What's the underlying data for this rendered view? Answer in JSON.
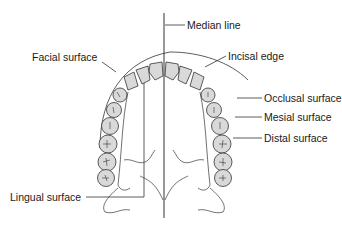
{
  "diagram": {
    "labels": {
      "median_line": "Median line",
      "facial_surface": "Facial surface",
      "incisal_edge": "Incisal edge",
      "occlusal_surface": "Occlusal surface",
      "mesial_surface": "Mesial surface",
      "distal_surface": "Distal surface",
      "lingual_surface": "Lingual surface"
    },
    "colors": {
      "tooth_fill": "#d9d9d9",
      "line": "#333333",
      "text": "#1a1a1a",
      "background": "#ffffff"
    }
  }
}
